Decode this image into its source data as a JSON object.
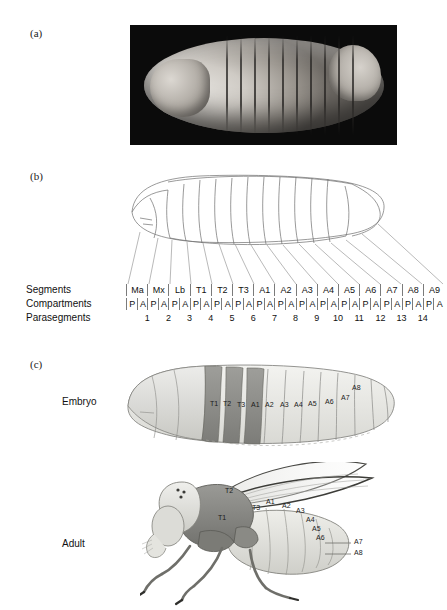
{
  "figure": {
    "panels": {
      "a": "(a)",
      "b": "(b)",
      "c": "(c)"
    }
  },
  "panel_b": {
    "row_labels": {
      "segments": "Segments",
      "compartments": "Compartments",
      "parasegments": "Parasegments"
    },
    "segments": [
      "Ma",
      "Mx",
      "Lb",
      "T1",
      "T2",
      "T3",
      "A1",
      "A2",
      "A3",
      "A4",
      "A5",
      "A6",
      "A7",
      "A8",
      "A9"
    ],
    "compartments": [
      "P",
      "A",
      "P",
      "A",
      "P",
      "A",
      "P",
      "A",
      "P",
      "A",
      "P",
      "A",
      "P",
      "A",
      "P",
      "A",
      "P",
      "A",
      "P",
      "A",
      "P",
      "A",
      "P",
      "A",
      "P",
      "A",
      "P",
      "A",
      "P",
      "A"
    ],
    "parasegments": [
      "1",
      "2",
      "3",
      "4",
      "5",
      "6",
      "7",
      "8",
      "9",
      "10",
      "11",
      "12",
      "13",
      "14"
    ]
  },
  "panel_c": {
    "embryo_label": "Embryo",
    "adult_label": "Adult",
    "embryo_segments": [
      "T1",
      "T2",
      "T3",
      "A1",
      "A2",
      "A3",
      "A4",
      "A5",
      "A6",
      "A7",
      "A8"
    ],
    "adult_segments": [
      "T1",
      "T2",
      "T3",
      "A1",
      "A2",
      "A3",
      "A4",
      "A5",
      "A6"
    ],
    "adult_callouts": [
      "A7",
      "A8"
    ]
  },
  "colors": {
    "thoracic_dark": "#8d8d8d",
    "abdominal_light": "#e6e6e2",
    "head_light": "#d8d8d2",
    "outline": "#6b6b6b",
    "photo_background": "#0b0b0b",
    "text": "#1a1a1a"
  }
}
